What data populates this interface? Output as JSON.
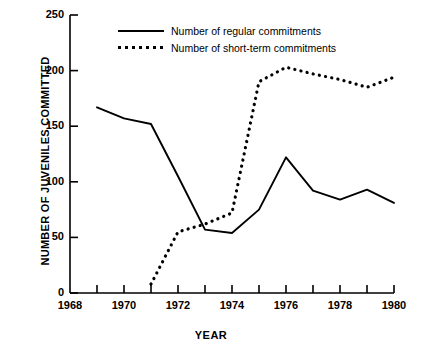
{
  "chart_data": {
    "type": "line",
    "title": "",
    "xlabel": "YEAR",
    "ylabel": "NUMBER OF JUVENILES COMMITTED",
    "xlim": [
      1968,
      1980
    ],
    "ylim": [
      0,
      250
    ],
    "ytick_labels": [
      "0",
      "50",
      "100",
      "150",
      "200",
      "250"
    ],
    "ytick_values": [
      0,
      50,
      100,
      150,
      200,
      250
    ],
    "xtick_labels": [
      "1968",
      "1970",
      "1972",
      "1974",
      "1976",
      "1978",
      "1980"
    ],
    "xtick_values": [
      1968,
      1970,
      1972,
      1974,
      1976,
      1978,
      1980
    ],
    "xtick_minor_values": [
      1969,
      1971,
      1973,
      1975,
      1977,
      1979
    ],
    "grid": false,
    "legend_position": "top-center",
    "series": [
      {
        "name": "Number of regular commitments",
        "style": "solid",
        "color": "#000000",
        "x": [
          1969,
          1970,
          1971,
          1972,
          1973,
          1974,
          1975,
          1976,
          1977,
          1978,
          1979,
          1980
        ],
        "values": [
          167,
          157,
          152,
          105,
          57,
          54,
          75,
          122,
          92,
          84,
          93,
          81
        ]
      },
      {
        "name": "Number of short-term commitments",
        "style": "dotted",
        "color": "#000000",
        "x": [
          1971,
          1972,
          1973,
          1974,
          1975,
          1976,
          1977,
          1978,
          1979,
          1980
        ],
        "values": [
          8,
          55,
          62,
          72,
          190,
          203,
          197,
          192,
          185,
          194
        ]
      }
    ]
  }
}
